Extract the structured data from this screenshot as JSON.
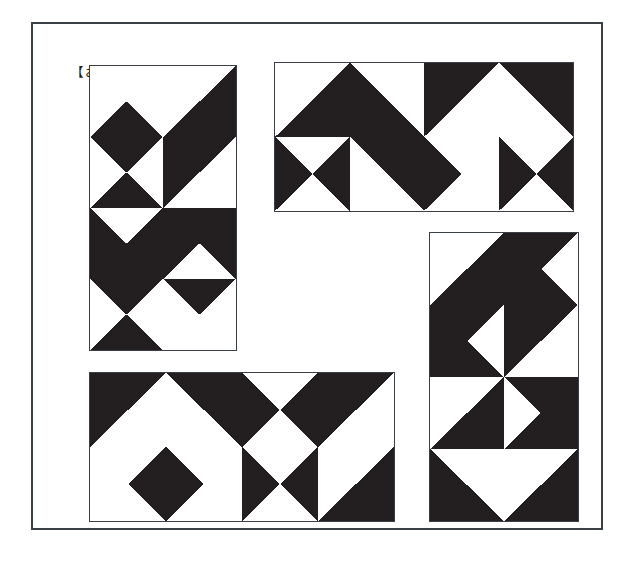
{
  "sheet": {
    "title": "【お手本】",
    "frame_color": "#3a3f45",
    "fill_color": "#231f20",
    "background_color": "#ffffff"
  },
  "panels": [
    {
      "id": "panel-top-left",
      "name": "tile-panel-top-left",
      "x": 87,
      "y": 63,
      "width": 148,
      "height": 286,
      "cols": 2,
      "rows": 4,
      "tiles": [
        {
          "row": 1,
          "col": 1,
          "base": "light",
          "triangles": [
            "bottom"
          ]
        },
        {
          "row": 1,
          "col": 2,
          "base": "light",
          "triangles": [
            "bottom",
            "right"
          ]
        },
        {
          "row": 2,
          "col": 1,
          "base": "light",
          "triangles": [
            "top",
            "bottom"
          ]
        },
        {
          "row": 2,
          "col": 2,
          "base": "light",
          "triangles": [
            "top",
            "left"
          ]
        },
        {
          "row": 3,
          "col": 1,
          "base": "dark",
          "triangles": [
            "top-light"
          ]
        },
        {
          "row": 3,
          "col": 2,
          "base": "dark",
          "triangles": [
            "bottom-light"
          ]
        },
        {
          "row": 4,
          "col": 1,
          "base": "light",
          "triangles": [
            "top",
            "bottom"
          ]
        },
        {
          "row": 4,
          "col": 2,
          "base": "light",
          "triangles": [
            "top"
          ]
        }
      ]
    },
    {
      "id": "panel-top-right",
      "name": "tile-panel-top-right",
      "x": 272,
      "y": 60,
      "width": 300,
      "height": 150,
      "cols": 4,
      "rows": 2,
      "tiles": [
        {
          "row": 1,
          "col": 1,
          "base": "light",
          "triangles": [
            "bottom",
            "right"
          ]
        },
        {
          "row": 1,
          "col": 2,
          "base": "dark",
          "triangles": [
            "top-light",
            "right-light"
          ]
        },
        {
          "row": 1,
          "col": 3,
          "base": "dark",
          "triangles": [
            "bottom-light",
            "right-light"
          ]
        },
        {
          "row": 1,
          "col": 4,
          "base": "dark",
          "triangles": [
            "bottom-light",
            "left-light"
          ]
        },
        {
          "row": 2,
          "col": 1,
          "base": "light",
          "triangles": [
            "left",
            "right"
          ]
        },
        {
          "row": 2,
          "col": 2,
          "base": "light",
          "triangles": [
            "top",
            "right"
          ]
        },
        {
          "row": 2,
          "col": 3,
          "base": "light",
          "triangles": [
            "left"
          ]
        },
        {
          "row": 2,
          "col": 4,
          "base": "light",
          "triangles": [
            "left",
            "right"
          ]
        }
      ]
    },
    {
      "id": "panel-bottom-left",
      "name": "tile-panel-bottom-left",
      "x": 87,
      "y": 370,
      "width": 306,
      "height": 150,
      "cols": 4,
      "rows": 2,
      "tiles": [
        {
          "row": 1,
          "col": 1,
          "base": "dark",
          "triangles": [
            "bottom-light",
            "right-light"
          ]
        },
        {
          "row": 1,
          "col": 2,
          "base": "dark",
          "triangles": [
            "bottom-light",
            "left-light"
          ]
        },
        {
          "row": 1,
          "col": 3,
          "base": "light",
          "triangles": [
            "left",
            "right"
          ]
        },
        {
          "row": 1,
          "col": 4,
          "base": "light",
          "triangles": [
            "top",
            "left"
          ]
        },
        {
          "row": 2,
          "col": 1,
          "base": "light",
          "triangles": [
            "right"
          ]
        },
        {
          "row": 2,
          "col": 2,
          "base": "light",
          "triangles": [
            "left"
          ]
        },
        {
          "row": 2,
          "col": 3,
          "base": "light",
          "triangles": [
            "left",
            "right"
          ]
        },
        {
          "row": 2,
          "col": 4,
          "base": "light",
          "triangles": [
            "bottom",
            "right"
          ]
        }
      ]
    },
    {
      "id": "panel-right",
      "name": "tile-panel-right",
      "x": 427,
      "y": 230,
      "width": 150,
      "height": 290,
      "cols": 2,
      "rows": 4,
      "tiles": [
        {
          "row": 1,
          "col": 1,
          "base": "light",
          "triangles": [
            "bottom",
            "right"
          ]
        },
        {
          "row": 1,
          "col": 2,
          "base": "light",
          "triangles": [
            "top",
            "bottom",
            "left"
          ]
        },
        {
          "row": 2,
          "col": 1,
          "base": "light",
          "triangles": [
            "top",
            "left",
            "bottom"
          ]
        },
        {
          "row": 2,
          "col": 2,
          "base": "light",
          "triangles": [
            "top",
            "left"
          ]
        },
        {
          "row": 3,
          "col": 1,
          "base": "light",
          "triangles": [
            "bottom",
            "right"
          ]
        },
        {
          "row": 3,
          "col": 2,
          "base": "light",
          "triangles": [
            "top",
            "bottom",
            "right"
          ]
        },
        {
          "row": 4,
          "col": 1,
          "base": "dark",
          "triangles": [
            "top-light",
            "right-light"
          ]
        },
        {
          "row": 4,
          "col": 2,
          "base": "dark",
          "triangles": [
            "top-light",
            "left-light"
          ]
        }
      ]
    }
  ]
}
